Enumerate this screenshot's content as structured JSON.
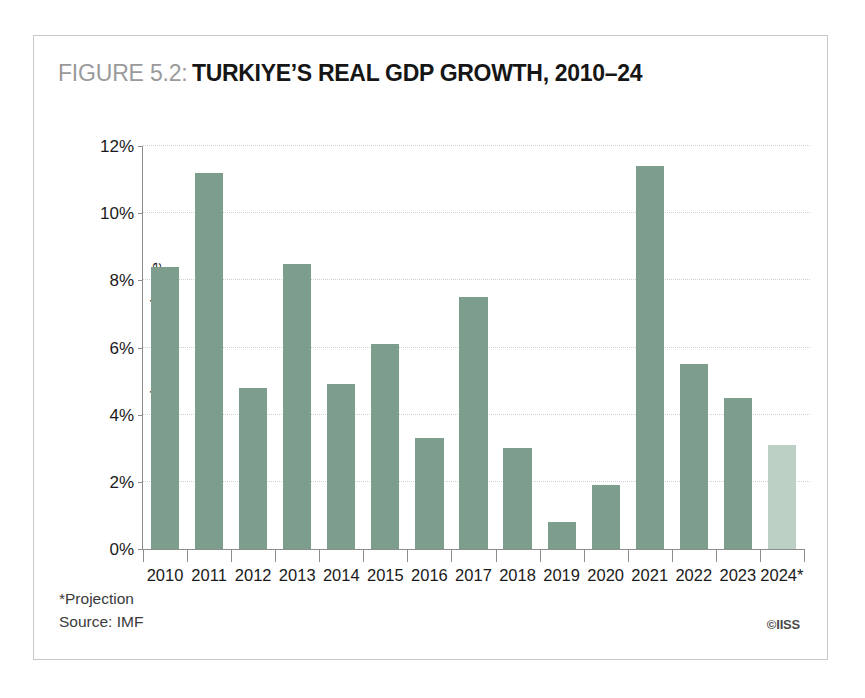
{
  "figure": {
    "label": "FIGURE 5.2:",
    "title": "TURKIYE’S REAL GDP GROWTH, 2010–24"
  },
  "footer": {
    "projection_note": "*Projection",
    "source": "Source: IMF",
    "credit": "©IISS"
  },
  "colors": {
    "bar": "#7d9e8c",
    "bar_projected": "#bdd0c6",
    "gridline": "#cfcfcf",
    "axis": "#8d8d8d",
    "frame": "#c9c9c9",
    "title_label": "#9a9a9a",
    "title_main": "#161616"
  },
  "chart_data": {
    "type": "bar",
    "title": "FIGURE 5.2: TURKIYE’S REAL GDP GROWTH, 2010–24",
    "xlabel": "",
    "ylabel": "annual percentage change",
    "ylim": [
      0,
      12
    ],
    "ytick_labels": [
      "12%",
      "10%",
      "8%",
      "6%",
      "4%",
      "2%",
      "0%"
    ],
    "ytick_values": [
      12,
      10,
      8,
      6,
      4,
      2,
      0
    ],
    "grid": true,
    "legend": "none",
    "categories": [
      "2010",
      "2011",
      "2012",
      "2013",
      "2014",
      "2015",
      "2016",
      "2017",
      "2018",
      "2019",
      "2020",
      "2021",
      "2022",
      "2023",
      "2024*"
    ],
    "values": [
      8.4,
      11.2,
      4.8,
      8.5,
      4.9,
      6.1,
      3.3,
      7.5,
      3.0,
      0.8,
      1.9,
      11.4,
      5.5,
      4.5,
      3.1
    ],
    "projected": [
      false,
      false,
      false,
      false,
      false,
      false,
      false,
      false,
      false,
      false,
      false,
      false,
      false,
      false,
      true
    ],
    "annotations": [
      "*Projection",
      "Source: IMF"
    ]
  }
}
